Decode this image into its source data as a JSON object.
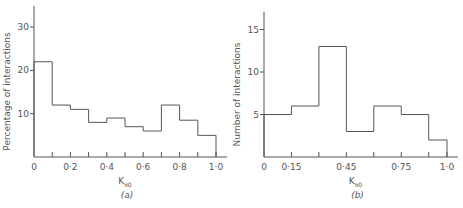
{
  "chart_data": [
    {
      "type": "bar",
      "id": "a",
      "caption": "(a)",
      "xlabel_main": "K",
      "xlabel_sub": "π0",
      "ylabel": "Percentage of interactions",
      "bin_edges": [
        0,
        0.1,
        0.2,
        0.3,
        0.4,
        0.5,
        0.6,
        0.7,
        0.8,
        0.9,
        1.0
      ],
      "values": [
        22,
        12,
        11,
        8,
        9,
        7,
        6,
        12,
        8.5,
        5
      ],
      "xticks": [
        0,
        0.1,
        0.2,
        0.3,
        0.4,
        0.5,
        0.6,
        0.7,
        0.8,
        0.9,
        1.0
      ],
      "xtick_labels": [
        "0",
        "",
        "0·2",
        "",
        "0·4",
        "",
        "0·6",
        "",
        "0·8",
        "",
        "1·0"
      ],
      "yticks": [
        10,
        20,
        30
      ],
      "ytick_labels": [
        "10",
        "20",
        "30"
      ],
      "xlim": [
        0,
        1.07
      ],
      "ylim": [
        0,
        35
      ],
      "grid": false
    },
    {
      "type": "bar",
      "id": "b",
      "caption": "(b)",
      "xlabel_main": "K",
      "xlabel_sub": "π0",
      "ylabel": "Number of interactions",
      "bin_edges": [
        0,
        0.15,
        0.3,
        0.45,
        0.6,
        0.75,
        0.9,
        1.0
      ],
      "values": [
        5,
        6,
        13,
        3,
        6,
        5,
        2
      ],
      "xticks": [
        0,
        0.15,
        0.3,
        0.45,
        0.6,
        0.75,
        0.9,
        1.0
      ],
      "xtick_labels": [
        "0",
        "0·15",
        "",
        "0·45",
        "",
        "0·75",
        "",
        "1·0"
      ],
      "yticks": [
        5,
        10,
        15
      ],
      "ytick_labels": [
        "5",
        "10",
        "15"
      ],
      "xlim": [
        0,
        1.06
      ],
      "ylim": [
        0,
        17
      ],
      "grid": false
    }
  ],
  "panels": [
    {
      "x0": 34,
      "x1": 216,
      "xend": 227,
      "y0": 157,
      "ytop": 6,
      "pxPerY": 4.33
    },
    {
      "x0": 264,
      "x1": 447,
      "xend": 458,
      "y0": 157,
      "ytop": 12,
      "pxPerY": 8.5
    }
  ]
}
